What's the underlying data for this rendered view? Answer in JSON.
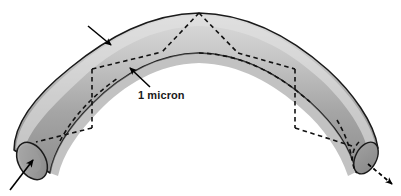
{
  "figure": {
    "name": "arched-tube-diagram",
    "background_color": "#ffffff"
  },
  "annotations": {
    "scale_label": "1 micron"
  },
  "colors": {
    "tube_fill_light": "#d2d2d2",
    "tube_fill_mid": "#a8a8a8",
    "tube_fill_dark": "#8d8d8d",
    "tube_fill_deep": "#7d7d7d",
    "outline": "#1a1a1a",
    "dashed_line": "#111111",
    "arrow": "#000000",
    "text": "#1a1a1a"
  },
  "geometry": {
    "width": 401,
    "height": 196,
    "tube_outer_apex_y": 13,
    "tube_inner_apex_y": 52,
    "left_cap_center": [
      32,
      152
    ],
    "right_cap_center": [
      362,
      150
    ]
  },
  "elements": {
    "tube_body": "arched-tube-body",
    "left_end_cap": "left-cylinder-end-cap",
    "right_end_cap": "right-cylinder-end-cap",
    "apex_chevron": "dashed-apex-chevron",
    "left_cross_section": "dashed-left-cross-section",
    "right_cross_section": "dashed-right-cross-section",
    "inner_dashed_edge": "dashed-inner-edge",
    "inflow_arrow": "inflow-arrow",
    "outflow_arrow": "outflow-arrow",
    "diameter_arrow_upper": "diameter-arrow-upper",
    "diameter_arrow_lower": "diameter-arrow-lower"
  }
}
